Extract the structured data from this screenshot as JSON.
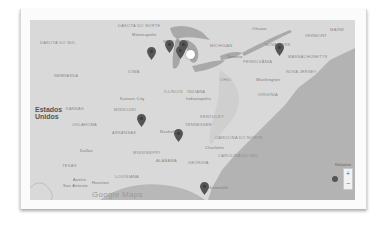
{
  "map": {
    "country_label": "Estados\nUnidos",
    "labels": [
      {
        "text": "Dakota do Norte",
        "x": 88,
        "y": 4,
        "kind": "state"
      },
      {
        "text": "Minneapolis",
        "x": 102,
        "y": 13,
        "kind": "city"
      },
      {
        "text": "Dakota do Sul",
        "x": 10,
        "y": 21,
        "kind": "state"
      },
      {
        "text": "Wisconsin",
        "x": 133,
        "y": 20,
        "kind": "state"
      },
      {
        "text": "Nebraska",
        "x": 24,
        "y": 54,
        "kind": "state"
      },
      {
        "text": "Iowa",
        "x": 98,
        "y": 50,
        "kind": "state"
      },
      {
        "text": "Illinois",
        "x": 134,
        "y": 70,
        "kind": "state"
      },
      {
        "text": "Indiana",
        "x": 157,
        "y": 70,
        "kind": "state"
      },
      {
        "text": "Indianapolis",
        "x": 156,
        "y": 77,
        "kind": "city"
      },
      {
        "text": "Kansas City",
        "x": 90,
        "y": 77,
        "kind": "city"
      },
      {
        "text": "Kansas",
        "x": 36,
        "y": 87,
        "kind": "state"
      },
      {
        "text": "Missouri",
        "x": 84,
        "y": 88,
        "kind": "state"
      },
      {
        "text": "Ottawa",
        "x": 222,
        "y": 7,
        "kind": "city"
      },
      {
        "text": "Michigan",
        "x": 180,
        "y": 24,
        "kind": "state"
      },
      {
        "text": "Toronto",
        "x": 197,
        "y": 35,
        "kind": "city"
      },
      {
        "text": "Vermont",
        "x": 275,
        "y": 14,
        "kind": "state"
      },
      {
        "text": "Maine",
        "x": 300,
        "y": 8,
        "kind": "state"
      },
      {
        "text": "Nova York",
        "x": 235,
        "y": 23,
        "kind": "state"
      },
      {
        "text": "Massachusetts",
        "x": 258,
        "y": 35,
        "kind": "state"
      },
      {
        "text": "Pensilvânia",
        "x": 213,
        "y": 40,
        "kind": "state"
      },
      {
        "text": "Ohio",
        "x": 190,
        "y": 58,
        "kind": "state"
      },
      {
        "text": "Nova Jersey",
        "x": 256,
        "y": 50,
        "kind": "state"
      },
      {
        "text": "Washington",
        "x": 226,
        "y": 58,
        "kind": "city"
      },
      {
        "text": "Virgínia",
        "x": 228,
        "y": 73,
        "kind": "state"
      },
      {
        "text": "Kentucky",
        "x": 170,
        "y": 95,
        "kind": "state"
      },
      {
        "text": "Tennessee",
        "x": 155,
        "y": 103,
        "kind": "state"
      },
      {
        "text": "Nashville",
        "x": 130,
        "y": 110,
        "kind": "city"
      },
      {
        "text": "Oklahoma",
        "x": 42,
        "y": 103,
        "kind": "state"
      },
      {
        "text": "Arkansas",
        "x": 82,
        "y": 111,
        "kind": "state"
      },
      {
        "text": "Carolina do Norte",
        "x": 185,
        "y": 116,
        "kind": "state"
      },
      {
        "text": "Charlotte",
        "x": 175,
        "y": 126,
        "kind": "city"
      },
      {
        "text": "Carolina do Sul",
        "x": 188,
        "y": 134,
        "kind": "state"
      },
      {
        "text": "Mississippi",
        "x": 103,
        "y": 131,
        "kind": "state"
      },
      {
        "text": "Alabama",
        "x": 126,
        "y": 139,
        "kind": "state"
      },
      {
        "text": "Geórgia",
        "x": 158,
        "y": 141,
        "kind": "state"
      },
      {
        "text": "Dallas",
        "x": 50,
        "y": 129,
        "kind": "city"
      },
      {
        "text": "Texas",
        "x": 32,
        "y": 144,
        "kind": "state"
      },
      {
        "text": "Austin",
        "x": 43,
        "y": 158,
        "kind": "city"
      },
      {
        "text": "San Antonio",
        "x": 33,
        "y": 164,
        "kind": "city"
      },
      {
        "text": "Houston",
        "x": 62,
        "y": 161,
        "kind": "city"
      },
      {
        "text": "Louisiana",
        "x": 85,
        "y": 155,
        "kind": "state"
      },
      {
        "text": "Jacksonville",
        "x": 173,
        "y": 166,
        "kind": "city"
      }
    ],
    "markers": [
      {
        "name": "marker-chicago-1",
        "x": 121,
        "y": 38
      },
      {
        "name": "marker-michigan-1",
        "x": 139,
        "y": 31
      },
      {
        "name": "marker-michigan-2",
        "x": 150,
        "y": 37
      },
      {
        "name": "marker-detroit",
        "x": 153,
        "y": 31
      },
      {
        "name": "marker-new-york",
        "x": 249,
        "y": 34
      },
      {
        "name": "marker-nashville",
        "x": 111,
        "y": 105
      },
      {
        "name": "marker-atlanta",
        "x": 148,
        "y": 120
      },
      {
        "name": "marker-florida",
        "x": 174,
        "y": 173
      }
    ],
    "highlight_marker": {
      "x": 160,
      "y": 33
    },
    "attribution": "Google Maps",
    "scale_label": "Relatório",
    "zoom_in_label": "+",
    "zoom_out_label": "−"
  },
  "colors": {
    "land": "#d9d9d9",
    "water": "#a9a9a9",
    "marker": "#555555",
    "frame": "#fbfbfb"
  }
}
